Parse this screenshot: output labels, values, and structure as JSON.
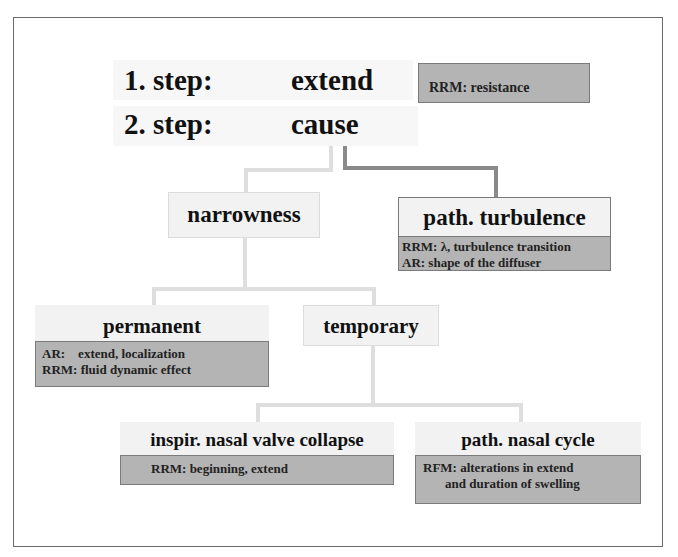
{
  "steps": [
    {
      "label": "1. step:",
      "value": "extend",
      "note": "RRM: resistance"
    },
    {
      "label": "2. step:",
      "value": "cause"
    }
  ],
  "nodes": {
    "narrowness": {
      "title": "narrowness"
    },
    "path_turbulence": {
      "title": "path. turbulence",
      "notes": [
        "RRM: λ, turbulence transition",
        "AR: shape of the diffuser"
      ]
    },
    "permanent": {
      "title": "permanent",
      "notes": [
        "AR:    extend, localization",
        "RRM: fluid dynamic effect"
      ]
    },
    "temporary": {
      "title": "temporary"
    },
    "inspir_nasal_valve_collapse": {
      "title": "inspir. nasal valve collapse",
      "notes": [
        "RRM: beginning, extend"
      ]
    },
    "path_nasal_cycle": {
      "title": "path. nasal cycle",
      "notes": [
        "RFM: alterations in extend",
        "and duration of swelling"
      ]
    }
  },
  "colors": {
    "note_box": "#b4b4b4",
    "title_box": "#f2f2f2",
    "connector_light": "#dedede",
    "connector_dark": "#8a8a8a",
    "frame": "#6a6a6a"
  }
}
